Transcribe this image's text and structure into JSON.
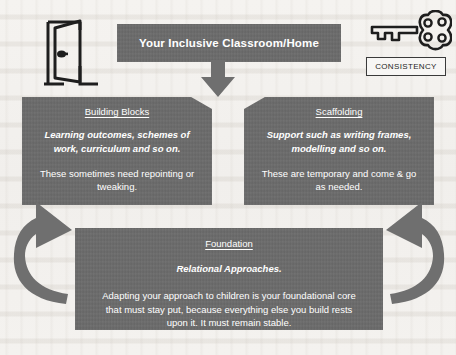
{
  "diagram": {
    "header": {
      "title": "Your Inclusive Classroom/Home"
    },
    "icons": {
      "door": "open-door-icon",
      "key": "key-icon",
      "down_arrow": "down-arrow-icon",
      "left_feedback_arrow": "curved-up-left-arrow-icon",
      "right_feedback_arrow": "curved-up-right-arrow-icon"
    },
    "consistency_label": "CONSISTENCY",
    "boxes": [
      {
        "id": "building-blocks",
        "heading": "Building Blocks",
        "emphasis": "Learning outcomes, schemes of work, curriculum and so on.",
        "body": "These sometimes need repointing or tweaking."
      },
      {
        "id": "scaffolding",
        "heading": "Scaffolding",
        "emphasis": "Support such as writing frames, modelling and so on.",
        "body": "These are temporary and come & go as needed."
      },
      {
        "id": "foundation",
        "heading": "Foundation",
        "emphasis": "Relational Approaches.",
        "body": "Adapting your approach to children is your foundational core that must stay put, because everything else you build rests upon it. It must remain stable."
      }
    ],
    "colors": {
      "panel_fill": "#6b6b6b",
      "panel_text": "#ffffff",
      "arrow_fill": "#6f6f6f",
      "page_background": "#f3f1ee",
      "ink": "#1e1e1e"
    }
  }
}
